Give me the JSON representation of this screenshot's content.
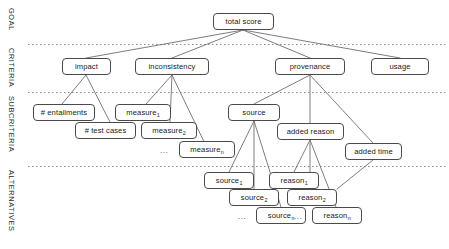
{
  "diagram": {
    "type": "tree-hierarchy",
    "background_color": "#ffffff",
    "node_border_color": "#4a4a4a",
    "edge_color": "#6e6e6e",
    "divider_color": "#8a8a8a"
  },
  "bands": [
    {
      "id": "goal",
      "label": "GOAL"
    },
    {
      "id": "criteria",
      "label": "CRITERIA"
    },
    {
      "id": "subcriteria",
      "label": "SUBCRITERIA"
    },
    {
      "id": "alternatives",
      "label": "ALTERNATIVES"
    }
  ],
  "nodes": {
    "goal": [
      {
        "id": "total-score",
        "label": "total score"
      }
    ],
    "criteria": [
      {
        "id": "impact",
        "label": "impact"
      },
      {
        "id": "inconsistency",
        "label": "inconsistency"
      },
      {
        "id": "provenance",
        "label": "provenance"
      },
      {
        "id": "usage",
        "label": "usage"
      }
    ],
    "subcriteria": [
      {
        "id": "num-entailments",
        "label": "# entailments"
      },
      {
        "id": "num-test-cases",
        "label": "# test cases"
      },
      {
        "id": "measure-1",
        "label": "measure",
        "sub": "1"
      },
      {
        "id": "measure-2",
        "label": "measure",
        "sub": "2"
      },
      {
        "id": "measure-n",
        "label": "measure",
        "sub": "n"
      },
      {
        "id": "source",
        "label": "source"
      },
      {
        "id": "added-reason",
        "label": "added reason"
      },
      {
        "id": "added-time",
        "label": "added time"
      }
    ],
    "alternatives": [
      {
        "id": "source-1",
        "label": "source",
        "sub": "1"
      },
      {
        "id": "source-2",
        "label": "source",
        "sub": "2"
      },
      {
        "id": "source-n",
        "label": "source",
        "sub": "n"
      },
      {
        "id": "reason-1",
        "label": "reason",
        "sub": "1"
      },
      {
        "id": "reason-2",
        "label": "reason",
        "sub": "2"
      },
      {
        "id": "reason-n",
        "label": "reason",
        "sub": "n"
      }
    ]
  },
  "ellipses": [
    {
      "id": "ellipsis-measure",
      "label": "..."
    },
    {
      "id": "ellipsis-source",
      "label": "..."
    },
    {
      "id": "ellipsis-reason",
      "label": "..."
    }
  ]
}
